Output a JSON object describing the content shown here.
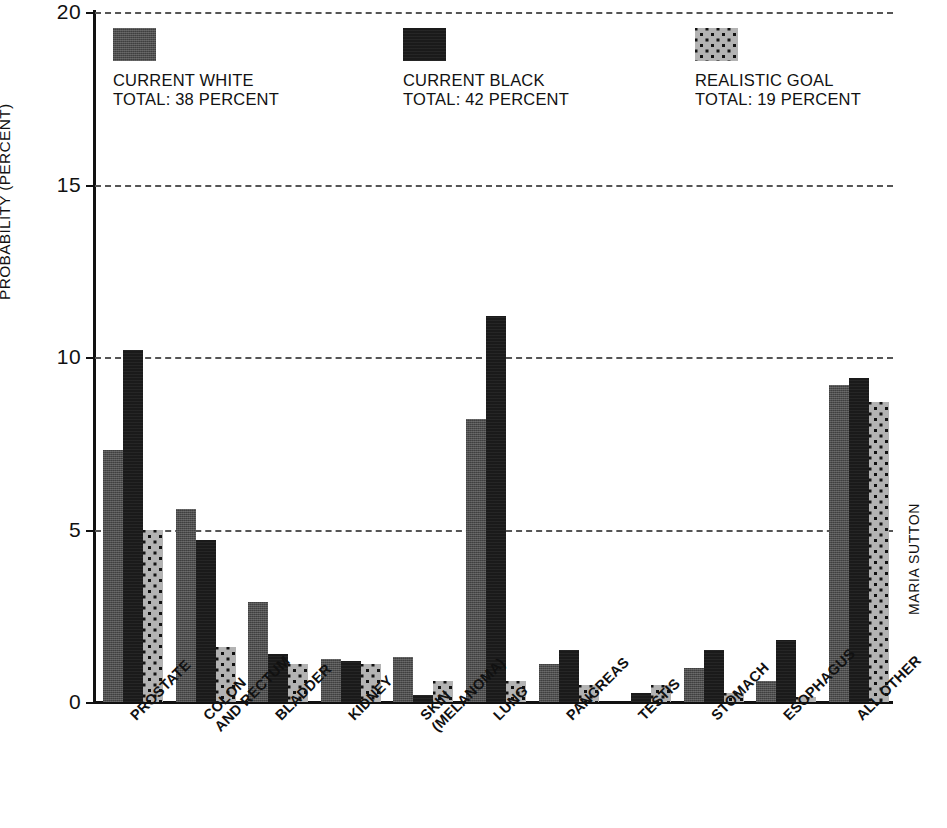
{
  "chart_data": {
    "type": "bar",
    "title": "",
    "xlabel": "",
    "ylabel": "PROBABILITY (PERCENT)",
    "ylim": [
      0,
      20
    ],
    "yticks": [
      0,
      5,
      10,
      15,
      20
    ],
    "ytick_labels": [
      "0",
      "5",
      "10",
      "15",
      "20"
    ],
    "grid": true,
    "legend_position": "top-left-inside",
    "categories": [
      "PROSTATE",
      "COLON AND RECTUM",
      "BLADDER",
      "KIDNEY",
      "SKIN (MELANOMA)",
      "LUNG",
      "PANCREAS",
      "TESTIS",
      "STOMACH",
      "ESOPHAGUS",
      "ALL OTHER"
    ],
    "category_lines": [
      [
        "PROSTATE",
        ""
      ],
      [
        "COLON",
        "AND RECTUM"
      ],
      [
        "BLADDER",
        ""
      ],
      [
        "KIDNEY",
        ""
      ],
      [
        "SKIN",
        "(MELANOMA)"
      ],
      [
        "LUNG",
        ""
      ],
      [
        "PANCREAS",
        ""
      ],
      [
        "TESTIS",
        ""
      ],
      [
        "STOMACH",
        ""
      ],
      [
        "ESOPHAGUS",
        ""
      ],
      [
        "ALL OTHER",
        ""
      ]
    ],
    "series": [
      {
        "name": "CURRENT WHITE",
        "total_label": "TOTAL: 38 PERCENT",
        "total": 38,
        "swatch": "medium-grey-noise",
        "color": "#4d4d4d",
        "values": [
          7.3,
          5.6,
          2.9,
          1.25,
          1.3,
          8.2,
          1.1,
          0.0,
          1.0,
          0.6,
          9.2
        ]
      },
      {
        "name": "CURRENT BLACK",
        "total_label": "TOTAL: 42 PERCENT",
        "total": 42,
        "swatch": "solid-black",
        "color": "#1a1a1a",
        "values": [
          10.2,
          4.7,
          1.4,
          1.2,
          0.2,
          11.2,
          1.5,
          0.25,
          1.5,
          1.8,
          9.4
        ]
      },
      {
        "name": "REALISTIC GOAL",
        "total_label": "TOTAL: 19 PERCENT",
        "total": 19,
        "swatch": "light-grey-dotted",
        "color": "#b3b3b3",
        "values": [
          5.0,
          1.6,
          1.1,
          1.1,
          0.6,
          0.6,
          0.5,
          0.5,
          0.25,
          0.15,
          8.7
        ]
      }
    ]
  },
  "legend": {
    "items": [
      {
        "label": "CURRENT WHITE",
        "total": "TOTAL: 38 PERCENT"
      },
      {
        "label": "CURRENT BLACK",
        "total": "TOTAL: 42 PERCENT"
      },
      {
        "label": "REALISTIC GOAL",
        "total": "TOTAL: 19 PERCENT"
      }
    ]
  },
  "credit": "MARIA SUTTON"
}
